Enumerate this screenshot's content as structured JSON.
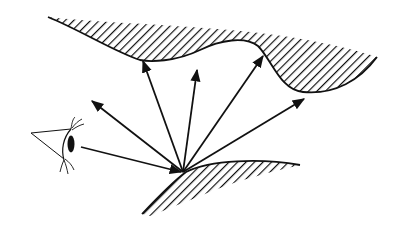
{
  "diagram": {
    "title": "",
    "colors": {
      "ink": "#111111",
      "background": "#ffffff"
    },
    "elements": {
      "observer": "eye-icon",
      "surfaces": [
        "upper-hatched-surface",
        "lower-hatched-surface"
      ],
      "incident_ray": {
        "from": [
          81,
          147
        ],
        "to": [
          183,
          172
        ]
      },
      "reflection_point": [
        183,
        172
      ],
      "reflected_rays": [
        {
          "to": [
            91,
            100
          ]
        },
        {
          "to": [
            143,
            59
          ]
        },
        {
          "to": [
            197,
            69
          ]
        },
        {
          "to": [
            263,
            54
          ]
        },
        {
          "to": [
            305,
            98
          ]
        }
      ]
    }
  }
}
